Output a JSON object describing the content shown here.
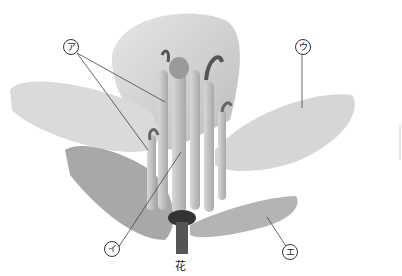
{
  "figure": {
    "caption": "花",
    "labels": [
      {
        "id": "a",
        "text": "ア",
        "x": 70,
        "y": 46,
        "targets": [
          [
            165,
            102
          ],
          [
            148,
            150
          ]
        ]
      },
      {
        "id": "i",
        "text": "イ",
        "x": 111,
        "y": 248,
        "targets": [
          [
            181,
            152
          ]
        ]
      },
      {
        "id": "u",
        "text": "ウ",
        "x": 302,
        "y": 46,
        "targets": [
          [
            302,
            108
          ]
        ]
      },
      {
        "id": "e",
        "text": "エ",
        "x": 289,
        "y": 251,
        "targets": [
          [
            267,
            217
          ]
        ]
      }
    ],
    "colors": {
      "background": "#ffffff",
      "petal": "#d9d9d9",
      "petal_shade": "#bdbdbd",
      "stamen": "#c8c8c8",
      "anther": "#6a6a6a",
      "stem": "#555555",
      "leader_line": "#444444"
    }
  }
}
